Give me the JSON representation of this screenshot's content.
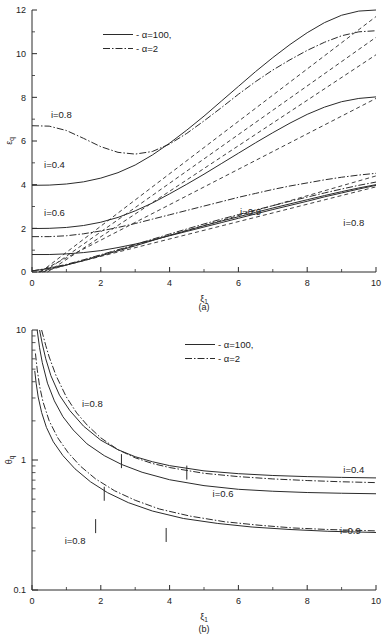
{
  "figure": {
    "panels": [
      {
        "id": "a",
        "panel_label": "(a)",
        "chart_data": {
          "type": "line",
          "title": "",
          "xlabel": "ξ₁",
          "ylabel": "ε_q",
          "xlim": [
            0,
            10
          ],
          "ylim": [
            0,
            12
          ],
          "xticks": [
            0,
            2,
            4,
            6,
            8,
            10
          ],
          "yticks": [
            0,
            2,
            4,
            6,
            8,
            10,
            12
          ],
          "xscale": "linear",
          "yscale": "linear",
          "grid": false,
          "legend": {
            "position": "upper-left-inside",
            "entries": [
              {
                "label": "α=100,",
                "style": "solid"
              },
              {
                "label": "α=2",
                "style": "dash-dot"
              }
            ]
          },
          "annotations": [
            {
              "text": "i=0.8",
              "x": 0.55,
              "y": 7.05
            },
            {
              "text": "i=0.4",
              "x": 0.35,
              "y": 4.75
            },
            {
              "text": "i=0.6",
              "x": 0.35,
              "y": 2.55
            },
            {
              "text": "i=0.9",
              "x": 6.05,
              "y": 2.6
            },
            {
              "text": "i=0.8",
              "x": 9.05,
              "y": 2.12
            }
          ],
          "series": [
            {
              "name": "i=0.8, α=2",
              "style": "dash-dot",
              "x": [
                0.0,
                0.5,
                1.0,
                1.5,
                2.0,
                2.5,
                3.0,
                3.5,
                4.0,
                4.5,
                5.0,
                5.5,
                6.0,
                6.5,
                7.0,
                7.5,
                8.0,
                8.5,
                9.0,
                9.5,
                10.0
              ],
              "y": [
                6.7,
                6.68,
                6.48,
                6.12,
                5.74,
                5.48,
                5.4,
                5.52,
                5.86,
                6.35,
                6.92,
                7.52,
                8.14,
                8.72,
                9.25,
                9.72,
                10.15,
                10.52,
                10.82,
                11.0,
                11.05
              ]
            },
            {
              "name": "i=0.4, α=100",
              "style": "solid",
              "x": [
                0.0,
                0.5,
                1.0,
                1.5,
                2.0,
                2.5,
                3.0,
                3.5,
                4.0,
                4.5,
                5.0,
                5.5,
                6.0,
                6.5,
                7.0,
                7.5,
                8.0,
                8.5,
                9.0,
                9.5,
                10.0
              ],
              "y": [
                3.97,
                3.98,
                4.03,
                4.13,
                4.3,
                4.55,
                4.9,
                5.36,
                5.9,
                6.5,
                7.14,
                7.82,
                8.5,
                9.18,
                9.82,
                10.42,
                10.96,
                11.42,
                11.76,
                11.95,
                12.0
              ]
            },
            {
              "name": "i=0.6, α=100",
              "style": "solid",
              "x": [
                0.0,
                0.5,
                1.0,
                1.5,
                2.0,
                2.5,
                3.0,
                3.5,
                4.0,
                4.5,
                5.0,
                5.5,
                6.0,
                6.5,
                7.0,
                7.5,
                8.0,
                8.5,
                9.0,
                9.5,
                10.0
              ],
              "y": [
                1.99,
                2.0,
                2.04,
                2.13,
                2.28,
                2.5,
                2.8,
                3.16,
                3.58,
                4.02,
                4.48,
                4.96,
                5.44,
                5.92,
                6.38,
                6.82,
                7.22,
                7.55,
                7.8,
                7.95,
                8.02
              ]
            },
            {
              "name": "i=0.6, α=2",
              "style": "dash-dot",
              "x": [
                0.0,
                0.5,
                1.0,
                1.5,
                2.0,
                2.5,
                3.0,
                3.5,
                4.0,
                4.5,
                5.0,
                5.5,
                6.0,
                6.5,
                7.0,
                7.5,
                8.0,
                8.5,
                9.0,
                9.5,
                10.0
              ],
              "y": [
                1.62,
                1.62,
                1.66,
                1.75,
                1.88,
                2.04,
                2.22,
                2.42,
                2.62,
                2.82,
                3.02,
                3.22,
                3.42,
                3.6,
                3.78,
                3.94,
                4.08,
                4.22,
                4.34,
                4.44,
                4.52
              ]
            },
            {
              "name": "i=0.8, α=100",
              "style": "solid",
              "x": [
                0.0,
                0.5,
                1.0,
                1.5,
                2.0,
                2.5,
                3.0,
                3.5,
                4.0,
                4.5,
                5.0,
                5.5,
                6.0,
                6.5,
                7.0,
                7.5,
                8.0,
                8.5,
                9.0,
                9.5,
                10.0
              ],
              "y": [
                0.8,
                0.8,
                0.83,
                0.89,
                0.98,
                1.12,
                1.28,
                1.46,
                1.66,
                1.86,
                2.06,
                2.26,
                2.46,
                2.66,
                2.86,
                3.05,
                3.24,
                3.44,
                3.62,
                3.8,
                3.97
              ]
            },
            {
              "name": "i=0.9, α=100 rising",
              "style": "solid",
              "x": [
                0.0,
                0.5,
                1.0,
                1.5,
                2.0,
                2.5,
                3.0,
                3.5,
                4.0,
                4.5,
                5.0,
                5.5,
                6.0,
                6.5,
                7.0,
                7.5,
                8.0,
                8.5,
                9.0,
                9.5,
                10.0
              ],
              "y": [
                0.05,
                0.16,
                0.32,
                0.52,
                0.74,
                0.97,
                1.2,
                1.44,
                1.68,
                1.9,
                2.12,
                2.33,
                2.53,
                2.73,
                2.93,
                3.12,
                3.31,
                3.5,
                3.68,
                3.85,
                4.0
              ]
            },
            {
              "name": "i=0.9, α=2",
              "style": "dash-dot",
              "x": [
                0.0,
                0.5,
                1.0,
                1.5,
                2.0,
                2.5,
                3.0,
                3.5,
                4.0,
                4.5,
                5.0,
                5.5,
                6.0,
                6.5,
                7.0,
                7.5,
                8.0,
                8.5,
                9.0,
                9.5,
                10.0
              ],
              "y": [
                0.05,
                0.18,
                0.35,
                0.56,
                0.79,
                1.02,
                1.26,
                1.5,
                1.74,
                1.97,
                2.2,
                2.42,
                2.63,
                2.84,
                3.04,
                3.24,
                3.43,
                3.62,
                3.8,
                3.97,
                4.12
              ]
            },
            {
              "name": "asymptote-1",
              "style": "dashed",
              "x": [
                0.25,
                10.0
              ],
              "y": [
                0.0,
                11.7
              ]
            },
            {
              "name": "asymptote-2",
              "style": "dashed",
              "x": [
                0.35,
                10.0
              ],
              "y": [
                0.0,
                10.75
              ]
            },
            {
              "name": "asymptote-3",
              "style": "dashed",
              "x": [
                0.45,
                10.0
              ],
              "y": [
                0.0,
                9.95
              ]
            },
            {
              "name": "asymptote-4",
              "style": "dashed",
              "x": [
                0.2,
                10.0
              ],
              "y": [
                0.0,
                7.95
              ]
            },
            {
              "name": "asymptote-5",
              "style": "dashed",
              "x": [
                0.3,
                10.0
              ],
              "y": [
                0.0,
                4.4
              ]
            },
            {
              "name": "asymptote-6",
              "style": "dashed",
              "x": [
                0.2,
                10.0
              ],
              "y": [
                0.0,
                3.9
              ]
            }
          ]
        }
      },
      {
        "id": "b",
        "panel_label": "(b)",
        "chart_data": {
          "type": "line",
          "title": "",
          "xlabel": "ξ₁",
          "ylabel": "θ_q",
          "xlim": [
            0,
            10
          ],
          "ylim": [
            0.1,
            10
          ],
          "xticks": [
            0,
            2,
            4,
            6,
            8,
            10
          ],
          "yticks": [
            0.1,
            1,
            10
          ],
          "ytick_labels": [
            "0.1",
            "1",
            "10"
          ],
          "xscale": "linear",
          "yscale": "log",
          "grid": false,
          "legend": {
            "position": "upper-right-inside",
            "entries": [
              {
                "label": "α=100,",
                "style": "solid"
              },
              {
                "label": "α=2",
                "style": "dash-dot"
              }
            ]
          },
          "annotations": [
            {
              "text": "i=0.8",
              "x": 1.45,
              "y": 2.55
            },
            {
              "text": "i=0.6",
              "x": 5.25,
              "y": 0.52
            },
            {
              "text": "i=0.4",
              "x": 9.05,
              "y": 0.8
            },
            {
              "text": "i=0.9",
              "x": 8.95,
              "y": 0.27
            },
            {
              "text": "i=0.8",
              "x": 0.95,
              "y": 0.225
            }
          ],
          "markers": [
            {
              "x": 2.6,
              "y": 0.98
            },
            {
              "x": 4.5,
              "y": 0.8
            },
            {
              "x": 2.1,
              "y": 0.55
            },
            {
              "x": 1.85,
              "y": 0.31
            },
            {
              "x": 3.9,
              "y": 0.265
            }
          ],
          "series": [
            {
              "name": "i=0.8, α=2",
              "style": "dash-dot",
              "x": [
                0.28,
                0.4,
                0.5,
                0.7,
                1.0,
                1.3,
                1.6,
                2.0,
                2.5,
                3.0,
                3.5,
                4.0,
                5.0,
                6.0,
                7.0,
                8.0,
                9.0,
                10.0
              ],
              "y": [
                10.0,
                7.6,
                6.2,
                4.45,
                3.05,
                2.3,
                1.86,
                1.48,
                1.2,
                1.04,
                0.94,
                0.875,
                0.79,
                0.745,
                0.715,
                0.695,
                0.68,
                0.67
              ]
            },
            {
              "name": "i=0.4, α=100",
              "style": "solid",
              "x": [
                0.22,
                0.3,
                0.4,
                0.55,
                0.8,
                1.1,
                1.5,
                2.0,
                2.5,
                3.0,
                3.5,
                4.0,
                5.0,
                6.0,
                7.0,
                8.0,
                9.0,
                10.0
              ],
              "y": [
                10.0,
                7.8,
                6.0,
                4.45,
                3.15,
                2.4,
                1.82,
                1.42,
                1.2,
                1.06,
                0.97,
                0.905,
                0.825,
                0.785,
                0.76,
                0.745,
                0.735,
                0.728
              ]
            },
            {
              "name": "i=0.6, α=100",
              "style": "solid",
              "x": [
                0.15,
                0.22,
                0.3,
                0.45,
                0.65,
                0.9,
                1.2,
                1.6,
                2.1,
                2.6,
                3.2,
                4.0,
                5.0,
                6.0,
                7.0,
                8.0,
                9.0,
                10.0
              ],
              "y": [
                10.0,
                7.3,
                5.6,
                3.9,
                2.85,
                2.15,
                1.7,
                1.33,
                1.08,
                0.925,
                0.805,
                0.705,
                0.635,
                0.595,
                0.575,
                0.562,
                0.555,
                0.55
              ]
            },
            {
              "name": "i=0.9, α=2",
              "style": "dash-dot",
              "x": [
                0.1,
                0.15,
                0.22,
                0.32,
                0.5,
                0.75,
                1.05,
                1.4,
                1.85,
                2.4,
                3.0,
                3.7,
                4.6,
                5.6,
                6.6,
                7.6,
                8.6,
                10.0
              ],
              "y": [
                6.6,
                5.0,
                3.7,
                2.8,
                2.0,
                1.48,
                1.14,
                0.9,
                0.715,
                0.58,
                0.49,
                0.42,
                0.37,
                0.335,
                0.315,
                0.3,
                0.292,
                0.285
              ]
            },
            {
              "name": "i=0.8, α=100",
              "style": "solid",
              "x": [
                0.08,
                0.12,
                0.18,
                0.28,
                0.42,
                0.62,
                0.9,
                1.25,
                1.7,
                2.2,
                2.8,
                3.5,
                4.4,
                5.4,
                6.4,
                7.5,
                8.6,
                10.0
              ],
              "y": [
                4.85,
                3.9,
                3.05,
                2.32,
                1.78,
                1.38,
                1.08,
                0.855,
                0.68,
                0.56,
                0.47,
                0.405,
                0.355,
                0.325,
                0.305,
                0.292,
                0.283,
                0.277
              ]
            }
          ]
        }
      }
    ]
  }
}
